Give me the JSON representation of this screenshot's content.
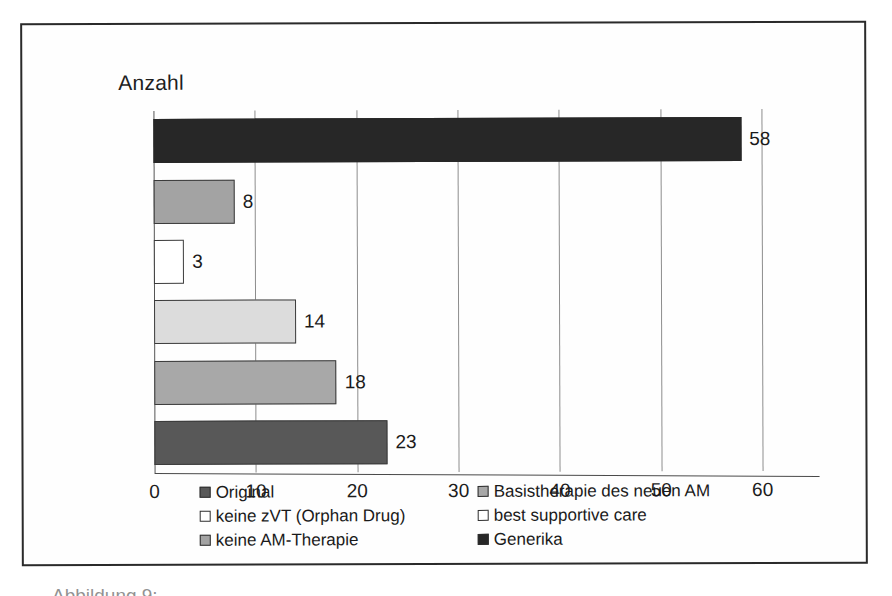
{
  "figure": {
    "caption_partial": "Abbildung 9: ... "
  },
  "chart_data": {
    "type": "bar",
    "orientation": "horizontal",
    "title": "Anzahl",
    "xlabel": "",
    "ylabel": "",
    "xlim": [
      0,
      60
    ],
    "xticks": [
      "0",
      "10",
      "20",
      "30",
      "40",
      "50",
      "60"
    ],
    "grid": true,
    "legend_position": "bottom",
    "categories": [
      "Generika",
      "keine AM-Therapie",
      "best supportive care",
      "keine zVT (Orphan Drug)",
      "Basistherapie des neuen AM",
      "Original"
    ],
    "values": [
      58,
      8,
      3,
      14,
      18,
      23
    ],
    "bars": [
      {
        "label": "Generika",
        "value": 58,
        "value_text": "58",
        "fill": "#272727"
      },
      {
        "label": "keine AM-Therapie",
        "value": 8,
        "value_text": "8",
        "fill": "#a3a3a3"
      },
      {
        "label": "best supportive care",
        "value": 3,
        "value_text": "3",
        "fill": "#ffffff"
      },
      {
        "label": "keine zVT (Orphan Drug)",
        "value": 14,
        "value_text": "14",
        "fill": "#dcdcdc"
      },
      {
        "label": "Basistherapie des neuen AM",
        "value": 18,
        "value_text": "18",
        "fill": "#a8a8a8"
      },
      {
        "label": "Original",
        "value": 23,
        "value_text": "23",
        "fill": "#585858"
      }
    ],
    "legend": [
      {
        "label": "Original",
        "color": "#585858"
      },
      {
        "label": "Basistherapie des neuen AM",
        "color": "#a8a8a8"
      },
      {
        "label": "keine zVT (Orphan Drug)",
        "color": "#ffffff"
      },
      {
        "label": "best supportive care",
        "color": "#ffffff"
      },
      {
        "label": "keine AM-Therapie",
        "color": "#a3a3a3"
      },
      {
        "label": "Generika",
        "color": "#272727"
      }
    ]
  }
}
